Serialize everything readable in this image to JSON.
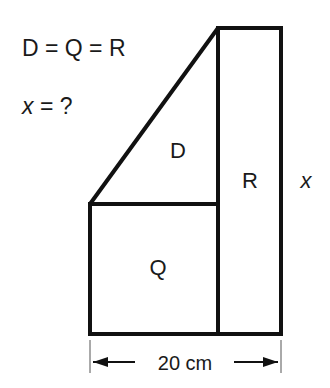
{
  "problem": {
    "condition": "D = Q = R",
    "question_label": "x",
    "question_rest": " = ?"
  },
  "figure": {
    "region_labels": {
      "triangle": "D",
      "square": "Q",
      "rectangle": "R"
    },
    "side_label": "x",
    "dimension": {
      "label": "20 cm"
    }
  },
  "colors": {
    "stroke": "#111111",
    "text": "#1a1a1a",
    "background": "#ffffff"
  }
}
